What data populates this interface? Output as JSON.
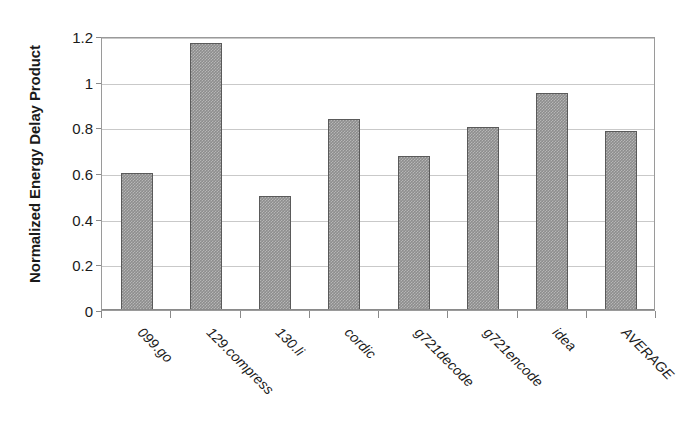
{
  "chart_data": {
    "type": "bar",
    "title": "",
    "subtitle": "",
    "xlabel": "",
    "ylabel": "Normalized Energy Delay Product",
    "categories": [
      "099.go",
      "129.compress",
      "130.li",
      "cordic",
      "g721decode",
      "g721encode",
      "idea",
      "AVERAGE"
    ],
    "values": [
      0.6,
      1.17,
      0.5,
      0.835,
      0.675,
      0.8,
      0.95,
      0.785
    ],
    "series": [
      {
        "name": "Normalized Energy Delay Product",
        "values": [
          0.6,
          1.17,
          0.5,
          0.835,
          0.675,
          0.8,
          0.95,
          0.785
        ]
      }
    ],
    "ylim": [
      0,
      1.2
    ],
    "ytick_values": [
      0,
      0.2,
      0.4,
      0.6,
      0.8,
      1,
      1.2
    ],
    "ytick_labels": [
      "0",
      "0.2",
      "0.4",
      "0.6",
      "0.8",
      "1",
      "1.2"
    ],
    "grid": true,
    "grid_axis": "y",
    "legend": false,
    "legend_position": "none",
    "bar_color": "#8d8d8d",
    "bar_border_color": "#5a5a5a",
    "gridline_color": "#c9c9c9",
    "axis_color": "#8a8a8a",
    "xtick_label_rotation": -45
  }
}
